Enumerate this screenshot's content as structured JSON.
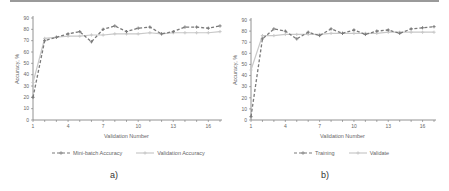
{
  "chart_data": [
    {
      "panel_label": "a)",
      "type": "line",
      "title": "",
      "xlabel": "Validation Number",
      "ylabel": "Accuracy, %",
      "x": [
        1,
        2,
        3,
        4,
        5,
        6,
        7,
        8,
        9,
        10,
        11,
        12,
        13,
        14,
        15,
        16,
        17
      ],
      "xticks": [
        1,
        4,
        7,
        10,
        13,
        16
      ],
      "yticks": [
        0,
        10,
        20,
        30,
        40,
        50,
        60,
        70,
        80,
        90
      ],
      "ylim": [
        0,
        90
      ],
      "xlim": [
        1,
        17
      ],
      "grid": false,
      "legend_position": "bottom",
      "series": [
        {
          "name": "Mini-batch Accuracy",
          "style": "dashed",
          "color": "#7a7a7a",
          "values": [
            20,
            70,
            73,
            76,
            78,
            69,
            80,
            83,
            78,
            81,
            82,
            76,
            78,
            82,
            82,
            81,
            83
          ]
        },
        {
          "name": "Validation Accuracy",
          "style": "solid",
          "color": "#c8c8c8",
          "values": [
            33,
            72,
            73,
            74,
            74,
            75,
            75,
            76,
            76,
            76,
            77,
            76,
            77,
            77,
            77,
            77,
            78
          ]
        }
      ]
    },
    {
      "panel_label": "b)",
      "type": "line",
      "title": "",
      "xlabel": "Validation Number",
      "ylabel": "Accuracy, %",
      "x": [
        1,
        2,
        3,
        4,
        5,
        6,
        7,
        8,
        9,
        10,
        11,
        12,
        13,
        14,
        15,
        16,
        17
      ],
      "xticks": [
        1,
        4,
        7,
        10,
        13,
        16
      ],
      "yticks": [
        0,
        10,
        20,
        30,
        40,
        50,
        60,
        70,
        80,
        90
      ],
      "ylim": [
        0,
        90
      ],
      "xlim": [
        1,
        17
      ],
      "grid": false,
      "legend_position": "bottom",
      "series": [
        {
          "name": "Training",
          "style": "dashed",
          "color": "#7a7a7a",
          "values": [
            3,
            73,
            82,
            80,
            73,
            79,
            76,
            82,
            78,
            81,
            77,
            80,
            81,
            78,
            82,
            83,
            84
          ]
        },
        {
          "name": "Validate",
          "style": "solid",
          "color": "#c8c8c8",
          "values": [
            45,
            76,
            76,
            77,
            77,
            77,
            77,
            78,
            78,
            78,
            78,
            78,
            79,
            79,
            79,
            79,
            79
          ]
        }
      ]
    }
  ]
}
